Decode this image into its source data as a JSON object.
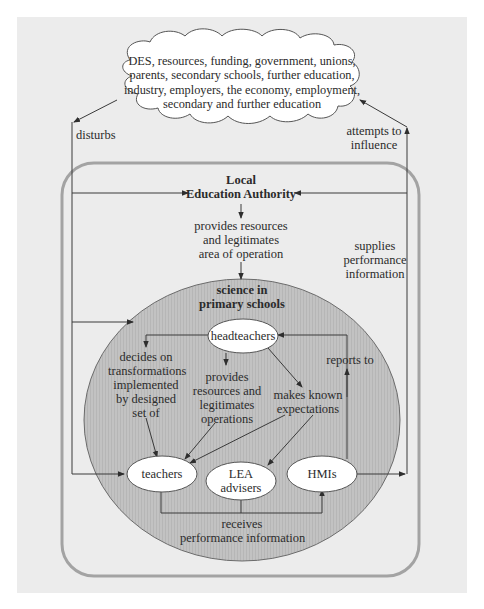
{
  "diagram": {
    "environment_cloud": {
      "lines": [
        "DES, resources, funding, government, unions,",
        "parents, secondary schools, further education,",
        "industry, employers, the economy, employment,",
        "secondary and further education"
      ]
    },
    "system_boundary": {
      "title_line1": "Local",
      "title_line2": "Education Authority"
    },
    "subsystem": {
      "title_line1": "science in",
      "title_line2": "primary schools"
    },
    "nodes": {
      "headteachers": "headteachers",
      "teachers": "teachers",
      "lea_advisers_line1": "LEA",
      "lea_advisers_line2": "advisers",
      "hmis": "HMIs"
    },
    "edge_labels": {
      "disturbs": "disturbs",
      "attempts_to_influence_line1": "attempts to",
      "attempts_to_influence_line2": "influence",
      "provides_resources_area_line1": "provides resources",
      "provides_resources_area_line2": "and legitimates",
      "provides_resources_area_line3": "area of operation",
      "supplies_performance_line1": "supplies",
      "supplies_performance_line2": "performance",
      "supplies_performance_line3": "information",
      "decides_line1": "decides on",
      "decides_line2": "transformations",
      "decides_line3": "implemented",
      "decides_line4": "by designed",
      "decides_line5": "set of",
      "provides_ops_line1": "provides",
      "provides_ops_line2": "resources and",
      "provides_ops_line3": "legitimates",
      "provides_ops_line4": "operations",
      "makes_known_line1": "makes known",
      "makes_known_line2": "expectations",
      "reports_to": "reports to",
      "receives_line1": "receives",
      "receives_line2": "performance information"
    },
    "colors": {
      "panel_bg": "#ececec",
      "boundary_stroke": "#a3a3a3",
      "subsystem_fill": "#bdbdbd",
      "node_fill": "#ffffff",
      "line": "#3a3a3a"
    }
  }
}
